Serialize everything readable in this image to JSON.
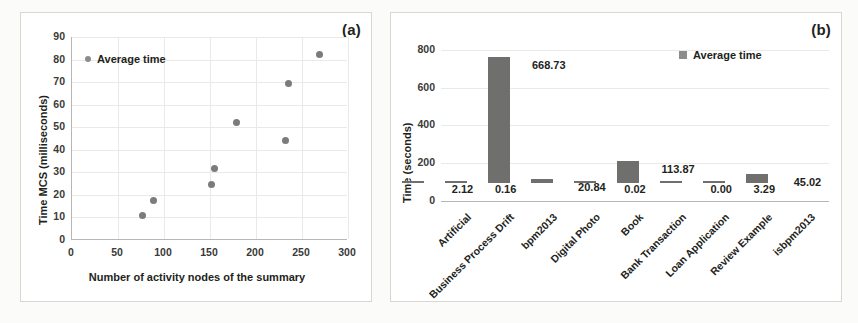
{
  "figure": {
    "panel_a_tag": "(a)",
    "panel_b_tag": "(b)"
  },
  "chart_data": [
    {
      "type": "scatter",
      "panel": "(a)",
      "title": "",
      "xlabel": "Number of activity nodes of the summary",
      "ylabel": "Time MCS (milliseconds)",
      "xlim": [
        0,
        300
      ],
      "ylim": [
        0,
        90
      ],
      "xticks": [
        0,
        50,
        100,
        150,
        200,
        250,
        300
      ],
      "yticks": [
        0,
        10,
        20,
        30,
        40,
        50,
        60,
        70,
        80,
        90
      ],
      "grid": true,
      "legend": [
        "Average time"
      ],
      "legend_position": "upper-left-inside",
      "series": [
        {
          "name": "Average time",
          "marker": "circle",
          "color": "#7b7b79",
          "points": [
            {
              "x": 77,
              "y": 10.8
            },
            {
              "x": 89,
              "y": 17.7
            },
            {
              "x": 152,
              "y": 24.8
            },
            {
              "x": 155,
              "y": 31.9
            },
            {
              "x": 179,
              "y": 52.2
            },
            {
              "x": 232,
              "y": 44.1
            },
            {
              "x": 235,
              "y": 69.6
            },
            {
              "x": 269,
              "y": 82.4
            }
          ]
        }
      ]
    },
    {
      "type": "bar",
      "panel": "(b)",
      "title": "",
      "xlabel": "",
      "ylabel": "Time (seconds)",
      "ylim": [
        0,
        900
      ],
      "yticks": [
        0,
        200,
        400,
        600,
        800
      ],
      "grid": true,
      "legend": [
        "Average time"
      ],
      "legend_position": "upper-right-inside",
      "bar_color": "#6f6f6d",
      "categories": [
        "Artificial",
        "Business Process Drift",
        "bpm2013",
        "Digital Photo",
        "Book",
        "Bank Transaction",
        "Loan Application",
        "Review Example",
        "isbpm2013"
      ],
      "values": [
        2.12,
        0.16,
        668.73,
        20.84,
        0.02,
        113.87,
        0.0,
        3.29,
        45.02
      ],
      "value_labels": [
        "2.12",
        "0.16",
        "668.73",
        "20.84",
        "0.02",
        "113.87",
        "0.00",
        "3.29",
        "45.02"
      ]
    }
  ]
}
